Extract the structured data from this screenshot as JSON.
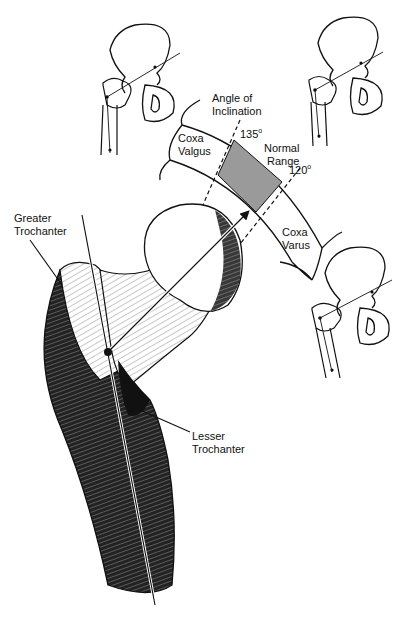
{
  "diagram": {
    "labels": {
      "angle_title_line1": "Angle of",
      "angle_title_line2": "Inclination",
      "coxa_valgus_line1": "Coxa",
      "coxa_valgus_line2": "Valgus",
      "coxa_varus_line1": "Coxa",
      "coxa_varus_line2": "Varus",
      "normal_range_line1": "Normal",
      "normal_range_line2": "Range",
      "angle_high": "135",
      "angle_low": "120",
      "degree_symbol": "o",
      "greater_trochanter_line1": "Greater",
      "greater_trochanter_line2": "Trochanter",
      "lesser_trochanter_line1": "Lesser",
      "lesser_trochanter_line2": "Trochanter"
    },
    "normal_range_degrees": [
      120,
      135
    ],
    "insets": [
      {
        "name": "coxa-valgus-pelvis"
      },
      {
        "name": "normal-pelvis"
      },
      {
        "name": "coxa-varus-pelvis"
      }
    ],
    "colors": {
      "ink": "#111111",
      "normal_range_fill": "#9a9a9a",
      "background": "#ffffff"
    }
  }
}
